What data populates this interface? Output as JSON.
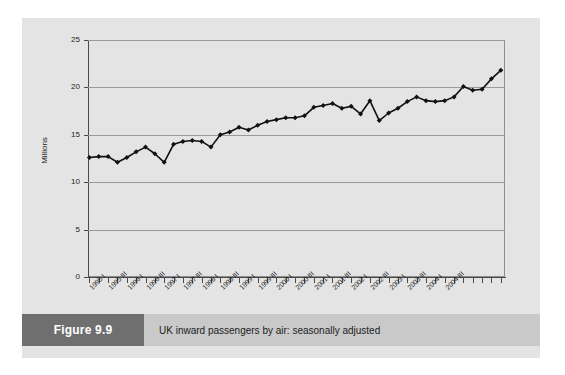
{
  "figure": {
    "caption_number": "Figure 9.9",
    "caption_title": "UK inward passengers by air: seasonally adjusted"
  },
  "chart_data": {
    "type": "line",
    "title": "UK inward passengers by air: seasonally adjusted",
    "xlabel": "",
    "ylabel": "Millions",
    "ylim": [
      0,
      25
    ],
    "yticks": [
      0,
      5,
      10,
      15,
      20,
      25
    ],
    "ytick_labels": [
      "0",
      "5",
      "10",
      "15",
      "20",
      "25"
    ],
    "grid": true,
    "legend": null,
    "marker": "diamond",
    "line_color": "#111111",
    "marker_color": "#111111",
    "categories": [
      "1995 I",
      "1995 II",
      "1995 III",
      "1995 IV",
      "1996 I",
      "1996 II",
      "1996 III",
      "1996 IV",
      "1997 I",
      "1997 II",
      "1997 III",
      "1997 IV",
      "1998 I",
      "1998 II",
      "1998 III",
      "1998 IV",
      "1999 I",
      "1999 II",
      "1999 III",
      "1999 IV",
      "2000 I",
      "2000 II",
      "2000 III",
      "2000 IV",
      "2001 I",
      "2001 II",
      "2001 III",
      "2001 IV",
      "2002 I",
      "2002 II",
      "2002 III",
      "2002 IV",
      "2003 I",
      "2003 II",
      "2003 III",
      "2003 IV",
      "2004 I",
      "2004 II",
      "2004 III",
      "2004 IV"
    ],
    "xtick_labels_shown": [
      "1995 I",
      "1995 III",
      "1996 I",
      "1996 III",
      "1997 I",
      "1997 III",
      "1998 I",
      "1998 III",
      "1999 I",
      "1999 III",
      "2000 I",
      "2000 III",
      "2001 I",
      "2001 III",
      "2002 I",
      "2002 III",
      "2003 I",
      "2003 III",
      "2004 I",
      "2004 III"
    ],
    "values": [
      12.6,
      12.7,
      12.7,
      12.1,
      12.6,
      13.2,
      13.7,
      13.0,
      12.1,
      14.0,
      14.3,
      14.4,
      14.3,
      13.7,
      15.0,
      15.3,
      15.8,
      15.5,
      16.0,
      16.4,
      16.6,
      16.8,
      16.8,
      17.0,
      17.9,
      18.1,
      18.3,
      17.8,
      18.0,
      17.2,
      18.6,
      16.5,
      17.3,
      17.8,
      18.5,
      19.0,
      18.6,
      18.5,
      18.6,
      19.0
    ],
    "values_tail": [
      20.1,
      19.7,
      19.8,
      20.9,
      21.8
    ]
  }
}
